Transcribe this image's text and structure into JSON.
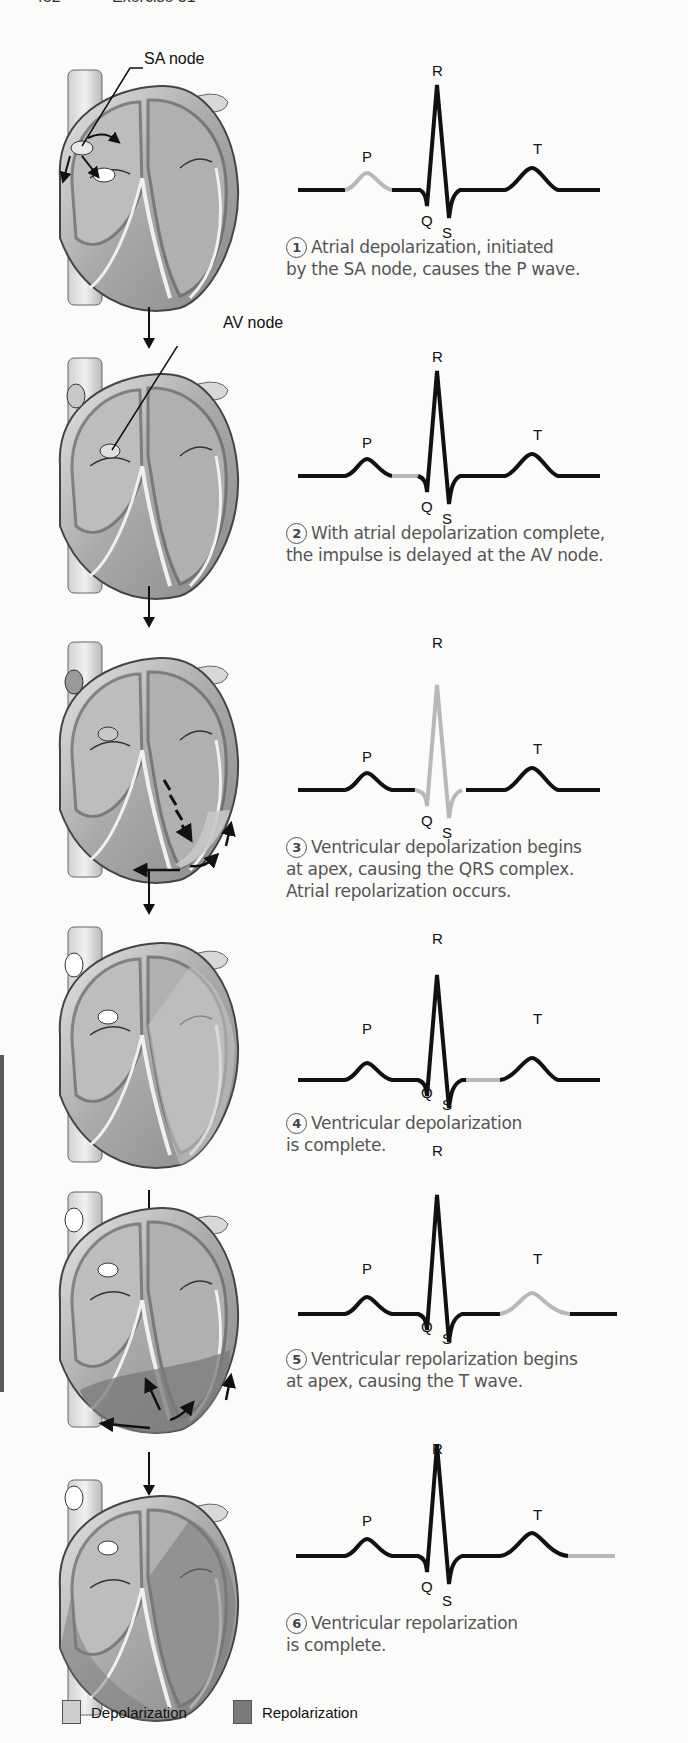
{
  "page_header": {
    "page_number": "452",
    "section": "Exercise 31"
  },
  "colors": {
    "trace_active": "#111111",
    "trace_highlight": "#b8b8b8",
    "depolarization": "#c8c8c8",
    "repolarization": "#7a7a7a",
    "caption_text": "#555555"
  },
  "labels": {
    "sa_node": "SA node",
    "av_node": "AV node",
    "P": "P",
    "Q": "Q",
    "R": "R",
    "S": "S",
    "T": "T"
  },
  "steps": [
    {
      "number": "1",
      "line1": "Atrial depolarization, initiated",
      "line2": "by the SA node, causes the P wave.",
      "line3": "",
      "highlight": "P"
    },
    {
      "number": "2",
      "line1": "With atrial depolarization complete,",
      "line2": "the impulse is delayed at the AV node.",
      "line3": "",
      "highlight": "PR"
    },
    {
      "number": "3",
      "line1": "Ventricular depolarization begins",
      "line2": "at apex, causing the QRS complex.",
      "line3": "Atrial repolarization occurs.",
      "highlight": "QRS"
    },
    {
      "number": "4",
      "line1": "Ventricular depolarization",
      "line2": "is complete.",
      "line3": "",
      "highlight": "ST"
    },
    {
      "number": "5",
      "line1": "Ventricular repolarization begins",
      "line2": "at apex, causing the T wave.",
      "line3": "",
      "highlight": "T"
    },
    {
      "number": "6",
      "line1": "Ventricular repolarization",
      "line2": "is complete.",
      "line3": "",
      "highlight": "post-T"
    }
  ],
  "legend": {
    "depolarization": "Depolarization",
    "repolarization": "Repolarization"
  }
}
